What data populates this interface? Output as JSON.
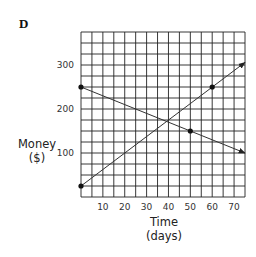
{
  "chart_data": {
    "type": "line",
    "panel_label": "D",
    "title": "",
    "xlabel": [
      "Time",
      "(days)"
    ],
    "ylabel": [
      "Money",
      "($)"
    ],
    "xlim": [
      0,
      75
    ],
    "ylim": [
      0,
      375
    ],
    "x_grid_step": 5,
    "y_grid_step": 25,
    "grid": true,
    "x_ticks": [
      10,
      20,
      30,
      40,
      50,
      60,
      70
    ],
    "y_ticks": [
      100,
      200,
      300
    ],
    "x_tick_labels": [
      "10",
      "20",
      "30",
      "40",
      "50",
      "60",
      "70"
    ],
    "y_tick_labels": [
      "100",
      "200",
      "300"
    ],
    "series": [
      {
        "name": "decreasing",
        "points": [
          [
            0,
            250
          ],
          [
            75,
            100
          ]
        ],
        "marked_points": [
          [
            0,
            250
          ],
          [
            50,
            150
          ]
        ],
        "arrow_end": true
      },
      {
        "name": "increasing",
        "points": [
          [
            0,
            25
          ],
          [
            75,
            306
          ]
        ],
        "marked_points": [
          [
            0,
            25
          ],
          [
            60,
            250
          ]
        ],
        "arrow_end": true
      }
    ],
    "legend": "none"
  }
}
